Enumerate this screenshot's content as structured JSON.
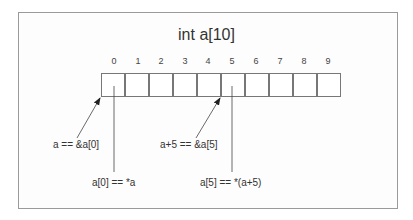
{
  "diagram": {
    "title": "int a[10]",
    "array": {
      "indices": [
        "0",
        "1",
        "2",
        "3",
        "4",
        "5",
        "6",
        "7",
        "8",
        "9"
      ],
      "cell_count": 10
    },
    "annotations": [
      {
        "id": "addr0",
        "text": "a == &a[0]",
        "kind": "arrow-to-cell-start",
        "target_index": 0
      },
      {
        "id": "val0",
        "text": "a[0] == *a",
        "kind": "line-into-cell",
        "target_index": 0
      },
      {
        "id": "addr5",
        "text": "a+5 == &a[5]",
        "kind": "arrow-to-cell-start",
        "target_index": 5
      },
      {
        "id": "val5",
        "text": "a[5] == *(a+5)",
        "kind": "line-into-cell",
        "target_index": 5
      }
    ],
    "colors": {
      "border": "#9a9a9a",
      "cell_border": "#777777",
      "text": "#333333",
      "arrow": "#333333"
    }
  }
}
